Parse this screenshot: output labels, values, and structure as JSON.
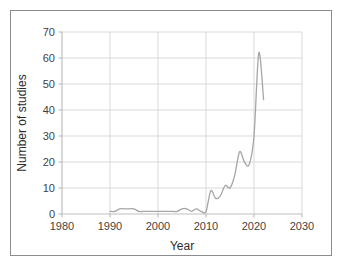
{
  "chart_data": {
    "type": "line",
    "title": "",
    "xlabel": "Year",
    "ylabel": "Number of studies",
    "xlim": [
      1980,
      2030
    ],
    "ylim": [
      0,
      70
    ],
    "xticks": [
      1980,
      1990,
      2000,
      2010,
      2020,
      2030
    ],
    "yticks": [
      0,
      10,
      20,
      30,
      40,
      50,
      60,
      70
    ],
    "grid": "horizontal-and-vertical",
    "legend": "none",
    "line_color": "#a6a6a6",
    "x": [
      1990,
      1991,
      1992,
      1993,
      1994,
      1995,
      1996,
      1997,
      1998,
      1999,
      2000,
      2001,
      2002,
      2003,
      2004,
      2005,
      2006,
      2007,
      2008,
      2009,
      2010,
      2011,
      2012,
      2013,
      2014,
      2015,
      2016,
      2017,
      2018,
      2019,
      2020,
      2021,
      2022
    ],
    "values": [
      1,
      1,
      2,
      2,
      2,
      2,
      1,
      1,
      1,
      1,
      1,
      1,
      1,
      1,
      1,
      2,
      2,
      1,
      2,
      1,
      1,
      9,
      6,
      7,
      11,
      10,
      15,
      24,
      20,
      19,
      30,
      62,
      44
    ],
    "series": [
      {
        "name": "Number of studies",
        "color": "#a6a6a6",
        "points": [
          {
            "year": 1990,
            "value": 1
          },
          {
            "year": 1991,
            "value": 1
          },
          {
            "year": 1992,
            "value": 2
          },
          {
            "year": 1993,
            "value": 2
          },
          {
            "year": 1994,
            "value": 2
          },
          {
            "year": 1995,
            "value": 2
          },
          {
            "year": 1996,
            "value": 1
          },
          {
            "year": 1997,
            "value": 1
          },
          {
            "year": 1998,
            "value": 1
          },
          {
            "year": 1999,
            "value": 1
          },
          {
            "year": 2000,
            "value": 1
          },
          {
            "year": 2001,
            "value": 1
          },
          {
            "year": 2002,
            "value": 1
          },
          {
            "year": 2003,
            "value": 1
          },
          {
            "year": 2004,
            "value": 1
          },
          {
            "year": 2005,
            "value": 2
          },
          {
            "year": 2006,
            "value": 2
          },
          {
            "year": 2007,
            "value": 1
          },
          {
            "year": 2008,
            "value": 2
          },
          {
            "year": 2009,
            "value": 1
          },
          {
            "year": 2010,
            "value": 1
          },
          {
            "year": 2011,
            "value": 9
          },
          {
            "year": 2012,
            "value": 6
          },
          {
            "year": 2013,
            "value": 7
          },
          {
            "year": 2014,
            "value": 11
          },
          {
            "year": 2015,
            "value": 10
          },
          {
            "year": 2016,
            "value": 15
          },
          {
            "year": 2017,
            "value": 24
          },
          {
            "year": 2018,
            "value": 20
          },
          {
            "year": 2019,
            "value": 19
          },
          {
            "year": 2020,
            "value": 30
          },
          {
            "year": 2021,
            "value": 62
          },
          {
            "year": 2022,
            "value": 44
          }
        ]
      }
    ]
  },
  "axes": {
    "y_tick_labels": [
      "0",
      "10",
      "20",
      "30",
      "40",
      "50",
      "60",
      "70"
    ],
    "x_tick_labels": [
      "1980",
      "1990",
      "2000",
      "2010",
      "2020",
      "2030"
    ],
    "x_axis_title": "Year",
    "y_axis_title": "Number of studies"
  },
  "style": {
    "grid_color": "#d9d9d9",
    "axis_color": "#bfbfbf",
    "frame_color": "#8c8c8c",
    "text_color": "#3f3f3f",
    "background": "#ffffff"
  }
}
